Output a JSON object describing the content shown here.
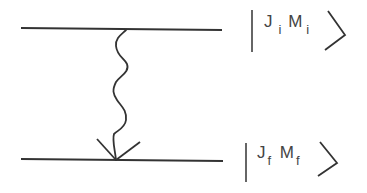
{
  "diagram": {
    "type": "energy-level transition diagram",
    "levels": [
      {
        "name": "initial",
        "label": "|J_i M_i⟩",
        "J": "J",
        "J_sub": "i",
        "M": "M",
        "M_sub": "i",
        "y": 29
      },
      {
        "name": "final",
        "label": "|J_f M_f⟩",
        "J": "J",
        "J_sub": "f",
        "M": "M",
        "M_sub": "f",
        "y": 160
      }
    ],
    "transition": {
      "kind": "photon emission (wavy arrow)",
      "from": "initial",
      "to": "final"
    },
    "colors": {
      "line": "#333333",
      "background": "#ffffff"
    }
  }
}
